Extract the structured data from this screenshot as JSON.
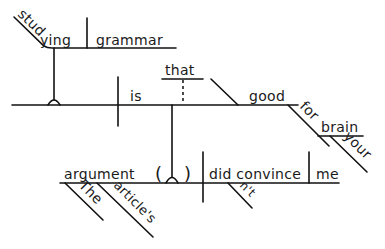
{
  "diagram": {
    "type": "Reed-Kellogg sentence diagram",
    "sentence_words": {
      "gerund_subject": "studying",
      "gerund_object": "grammar",
      "linking_verb": "is",
      "relative_that": "that",
      "predicate_adjective": "good",
      "preposition": "for",
      "prep_object": "brain",
      "prep_modifier": "your",
      "clause_subject": "argument",
      "det_the": "The",
      "possessive": "article's",
      "clause_verb": "did convince",
      "negation": "n't",
      "clause_object": "me",
      "paren_open": "(",
      "paren_close": ")"
    },
    "colors": {
      "ink": "#111111",
      "background": "#ffffff"
    }
  }
}
